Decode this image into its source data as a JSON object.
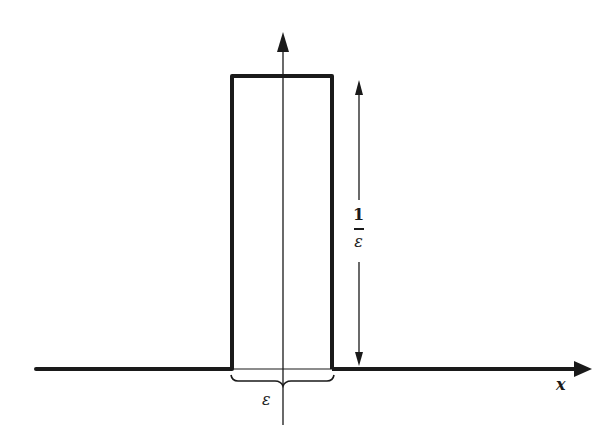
{
  "diagram": {
    "title": "",
    "colors": {
      "stroke": "#1a1a1a",
      "background": "#ffffff"
    },
    "labels": {
      "x_axis": "x",
      "width_label": "ε",
      "height_numerator": "1",
      "height_denominator": "ε"
    },
    "geometry": {
      "baseline_y": 369,
      "axis_x": 283,
      "pulse_left_x": 232,
      "pulse_right_x": 332,
      "pulse_top_y": 76
    }
  }
}
